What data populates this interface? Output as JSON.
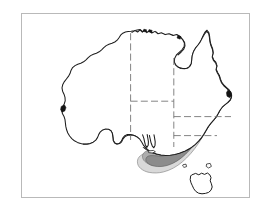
{
  "figure": {
    "title": "Distribution map of Australia",
    "caption": "",
    "subject": "Australia",
    "map_type": "species-distribution-map",
    "background_color": "#ffffff",
    "frame_color": "#b9b9b9",
    "coastline_color": "#1d1d1d",
    "state_border_color": "#6e6e6e",
    "state_border_style": "dashed"
  },
  "frame": {
    "x": 21,
    "y": 13,
    "width": 229,
    "height": 185
  },
  "legend": {
    "present": false,
    "entries": [
      {
        "label": "Core range",
        "color": "#8a8a8a"
      },
      {
        "label": "Intermediate range",
        "color": "#a8a8a8"
      },
      {
        "label": "Outer range",
        "color": "#d2d2d2"
      }
    ]
  },
  "landmasses": [
    {
      "name": "Australian mainland",
      "label": ""
    },
    {
      "name": "Tasmania",
      "label": ""
    },
    {
      "name": "Kangaroo Island",
      "label": ""
    },
    {
      "name": "Flinders Island",
      "label": ""
    },
    {
      "name": "King Island",
      "label": ""
    }
  ],
  "states": [
    {
      "name": "Western Australia",
      "abbr": "WA",
      "label": ""
    },
    {
      "name": "Northern Territory",
      "abbr": "NT",
      "label": ""
    },
    {
      "name": "South Australia",
      "abbr": "SA",
      "label": ""
    },
    {
      "name": "Queensland",
      "abbr": "QLD",
      "label": ""
    },
    {
      "name": "New South Wales",
      "abbr": "NSW",
      "label": ""
    },
    {
      "name": "Victoria",
      "abbr": "VIC",
      "label": ""
    },
    {
      "name": "Tasmania",
      "abbr": "TAS",
      "label": ""
    }
  ],
  "distribution": {
    "description": "Shaded band along the south-eastern coast extending from south-east Queensland through New South Wales into southern Victoria",
    "shading_levels": 3,
    "colors": {
      "outer": "#d2d2d2",
      "mid": "#a8a8a8",
      "core": "#8a8a8a"
    }
  },
  "annotations": [],
  "labels": []
}
